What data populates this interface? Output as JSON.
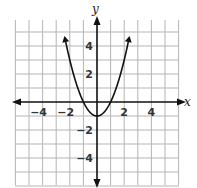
{
  "chart_data": {
    "type": "line",
    "title": "",
    "xlabel": "x",
    "ylabel": "y",
    "xlim": [
      -6,
      6
    ],
    "ylim": [
      -6,
      6
    ],
    "grid": true,
    "x_ticks": [
      "-4",
      "-2",
      "2",
      "4"
    ],
    "y_ticks": [
      "4",
      "2",
      "-2",
      "-4"
    ],
    "series": [
      {
        "name": "y = x^2 - 1",
        "x": [
          -2.3,
          -2,
          -1.5,
          -1,
          -0.5,
          0,
          0.5,
          1,
          1.5,
          2,
          2.3
        ],
        "y": [
          4.29,
          3,
          1.25,
          0,
          -0.75,
          -1,
          -0.75,
          0,
          1.25,
          3,
          4.29
        ]
      }
    ],
    "vertex": [
      0,
      -1
    ],
    "colors": {
      "curve": "#111111",
      "grid": "#b5b5b5",
      "axis": "#111111"
    }
  }
}
